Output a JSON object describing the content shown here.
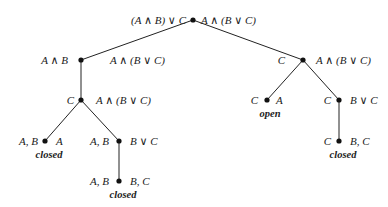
{
  "diagram": {
    "type": "tableau-tree",
    "colors": {
      "edge": "#222222",
      "node": "#111111",
      "text": "#222222"
    },
    "nodes": [
      {
        "id": "root",
        "x": 193,
        "y": 20,
        "left": "(A ∧ B) ∨ C",
        "right": "A ∧ (B ∨ C)"
      },
      {
        "id": "n1",
        "x": 81,
        "y": 60,
        "left": "A ∧ B",
        "right": "A ∧ (B ∨ C)"
      },
      {
        "id": "n2",
        "x": 303,
        "y": 60,
        "left": "C",
        "right": "A ∧ (B ∨ C)"
      },
      {
        "id": "n3",
        "x": 81,
        "y": 100,
        "left": "A, B",
        "right": "A ∧ (B ∨ C)"
      },
      {
        "id": "n4",
        "x": 45,
        "y": 141,
        "left": "A, B",
        "right": "A",
        "status": "closed"
      },
      {
        "id": "n5",
        "x": 119,
        "y": 141,
        "left": "A, B",
        "right": "B ∨ C"
      },
      {
        "id": "n6",
        "x": 119,
        "y": 181,
        "left": "A, B",
        "right": "B, C",
        "status": "closed"
      },
      {
        "id": "n7",
        "x": 267,
        "y": 100,
        "left": "C",
        "right": "A",
        "status": "open"
      },
      {
        "id": "n8",
        "x": 339,
        "y": 100,
        "left": "C",
        "right": "B ∨ C"
      },
      {
        "id": "n9",
        "x": 339,
        "y": 141,
        "left": "C",
        "right": "B, C",
        "status": "closed"
      }
    ],
    "edges": [
      [
        "root",
        "n1"
      ],
      [
        "root",
        "n2"
      ],
      [
        "n1",
        "n3"
      ],
      [
        "n3",
        "n4"
      ],
      [
        "n3",
        "n5"
      ],
      [
        "n5",
        "n6"
      ],
      [
        "n2",
        "n7"
      ],
      [
        "n2",
        "n8"
      ],
      [
        "n8",
        "n9"
      ]
    ]
  }
}
